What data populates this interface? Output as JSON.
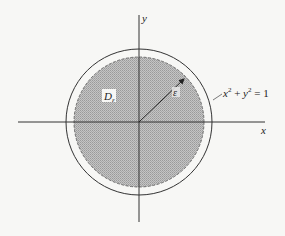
{
  "diagram": {
    "axes": {
      "x_label": "x",
      "y_label": "y"
    },
    "region_label": {
      "main": "D",
      "subscript": "ε"
    },
    "radius_label": "ε",
    "circle_equation": {
      "x": "x",
      "x_exp": "2",
      "plus": " + ",
      "y": "y",
      "y_exp": "2",
      "rhs": " = 1"
    },
    "colors": {
      "background": "#f7f7f5",
      "shaded_region": "#b8b8b8",
      "lines": "#333333"
    }
  }
}
